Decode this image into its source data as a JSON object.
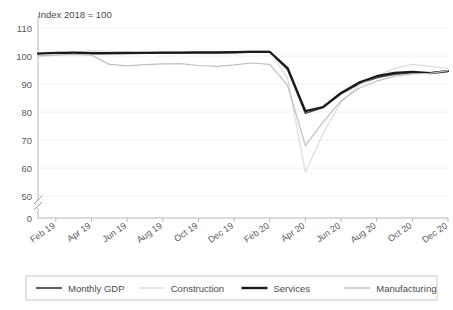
{
  "chart_data": {
    "type": "line",
    "title": "Index 2018 = 100",
    "subtitle": "",
    "xlabel": "",
    "ylabel": "",
    "ylim": [
      0,
      110
    ],
    "y_ticks": [
      0,
      50,
      60,
      70,
      80,
      90,
      100,
      110
    ],
    "y_axis_break": true,
    "y_axis_break_between": [
      0,
      50
    ],
    "grid": true,
    "grid_axis": "y",
    "legend_position": "bottom",
    "x": [
      "Jan 19",
      "Feb 19",
      "Mar 19",
      "Apr 19",
      "May 19",
      "Jun 19",
      "Jul 19",
      "Aug 19",
      "Sep 19",
      "Oct 19",
      "Nov 19",
      "Dec 19",
      "Jan 20",
      "Feb 20",
      "Mar 20",
      "Apr 20",
      "May 20",
      "Jun 20",
      "Jul 20",
      "Aug 20",
      "Sep 20",
      "Oct 20",
      "Nov 20",
      "Dec 20"
    ],
    "x_tick_labels": [
      "Feb 19",
      "Apr 19",
      "Jun 19",
      "Aug 19",
      "Oct 19",
      "Dec 19",
      "Feb 20",
      "Apr 20",
      "Jun 20",
      "Aug 20",
      "Oct 20",
      "Dec 20"
    ],
    "x_tick_indices": [
      1,
      3,
      5,
      7,
      9,
      11,
      13,
      15,
      17,
      19,
      21,
      23
    ],
    "series": [
      {
        "name": "Monthly GDP",
        "color": "#4d4d4d",
        "width": 1.5,
        "values": [
          100.8,
          101.0,
          101.1,
          100.8,
          100.9,
          100.9,
          101.0,
          101.0,
          101.1,
          101.1,
          101.1,
          101.2,
          101.4,
          101.3,
          95.2,
          79.5,
          81.6,
          86.5,
          90.0,
          92.2,
          93.5,
          94.0,
          93.9,
          94.7
        ]
      },
      {
        "name": "Construction",
        "color": "#dcdcdc",
        "width": 1.2,
        "values": [
          99.8,
          100.2,
          101.3,
          101.9,
          101.7,
          101.4,
          101.3,
          101.4,
          101.5,
          101.6,
          101.5,
          101.5,
          102.0,
          101.8,
          92.0,
          58.5,
          72.5,
          83.5,
          89.5,
          93.0,
          95.5,
          97.0,
          96.3,
          95.6
        ]
      },
      {
        "name": "Services",
        "color": "#1a1a1a",
        "width": 2.2,
        "values": [
          100.9,
          101.1,
          101.2,
          101.0,
          101.0,
          101.1,
          101.1,
          101.2,
          101.2,
          101.3,
          101.3,
          101.4,
          101.5,
          101.5,
          95.7,
          80.3,
          81.8,
          86.8,
          90.5,
          92.8,
          94.0,
          94.3,
          93.9,
          94.6
        ]
      },
      {
        "name": "Manufacturing",
        "color": "#bfbfbf",
        "width": 1.2,
        "values": [
          100.1,
          100.3,
          100.6,
          100.3,
          97.0,
          96.5,
          96.9,
          97.2,
          97.3,
          96.6,
          96.3,
          96.8,
          97.5,
          97.0,
          89.5,
          68.0,
          76.5,
          84.0,
          88.5,
          91.0,
          92.8,
          93.6,
          93.8,
          94.8
        ]
      }
    ]
  },
  "legend": {
    "items": [
      {
        "label": "Monthly GDP",
        "color": "#4d4d4d",
        "width": 1.8
      },
      {
        "label": "Construction",
        "color": "#dcdcdc",
        "width": 1.4
      },
      {
        "label": "Services",
        "color": "#1a1a1a",
        "width": 2.4
      },
      {
        "label": "Manufacturing",
        "color": "#bfbfbf",
        "width": 1.4
      }
    ]
  }
}
